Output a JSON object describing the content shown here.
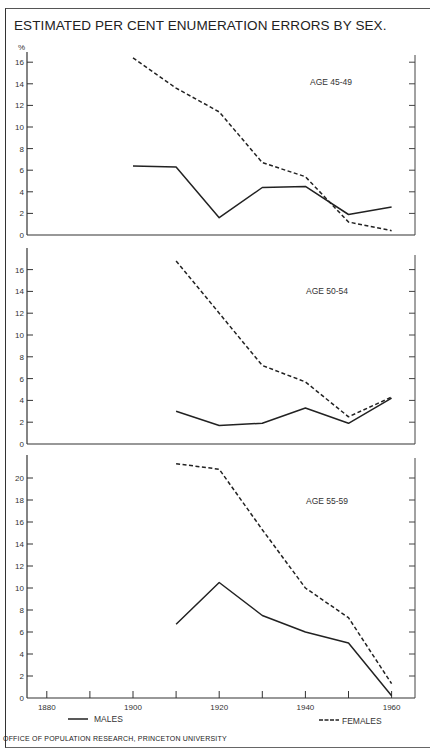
{
  "title": "ESTIMATED PER CENT ENUMERATION ERRORS BY SEX.",
  "y_unit": "%",
  "credit": "OFFICE OF POPULATION RESEARCH, PRINCETON UNIVERSITY",
  "legend": {
    "males": "MALES",
    "females": "FEMALES"
  },
  "x_ticks": [
    "1880",
    "1900",
    "1920",
    "1940",
    "1960"
  ],
  "chart_data": [
    {
      "type": "line",
      "title": "AGE 45-49",
      "xlabel": "",
      "ylabel": "%",
      "ylim": [
        0,
        17
      ],
      "yticks": [
        0,
        2,
        4,
        6,
        8,
        10,
        12,
        14,
        16
      ],
      "x": [
        1900,
        1910,
        1920,
        1930,
        1940,
        1950,
        1960
      ],
      "series": [
        {
          "name": "MALES",
          "style": "solid",
          "values": [
            6.4,
            6.3,
            1.6,
            4.4,
            4.5,
            1.9,
            2.6
          ]
        },
        {
          "name": "FEMALES",
          "style": "dashed",
          "values": [
            16.4,
            13.6,
            11.4,
            6.7,
            5.4,
            1.2,
            0.4
          ]
        }
      ]
    },
    {
      "type": "line",
      "title": "AGE 50-54",
      "xlabel": "",
      "ylabel": "%",
      "ylim": [
        0,
        18
      ],
      "yticks": [
        0,
        2,
        4,
        6,
        8,
        10,
        12,
        14,
        16
      ],
      "x": [
        1910,
        1920,
        1930,
        1940,
        1950,
        1960
      ],
      "series": [
        {
          "name": "MALES",
          "style": "solid",
          "values": [
            3.0,
            1.7,
            1.9,
            3.3,
            1.9,
            4.2
          ]
        },
        {
          "name": "FEMALES",
          "style": "dashed",
          "values": [
            16.8,
            12.0,
            7.2,
            5.7,
            2.5,
            4.3
          ]
        }
      ]
    },
    {
      "type": "line",
      "title": "AGE 55-59",
      "xlabel": "",
      "ylabel": "%",
      "ylim": [
        0,
        22
      ],
      "yticks": [
        0,
        2,
        4,
        6,
        8,
        10,
        12,
        14,
        16,
        18,
        20
      ],
      "x": [
        1910,
        1920,
        1930,
        1940,
        1950,
        1960
      ],
      "xticks": [
        1880,
        1900,
        1920,
        1940,
        1960
      ],
      "series": [
        {
          "name": "MALES",
          "style": "solid",
          "values": [
            6.7,
            10.5,
            7.5,
            6.0,
            5.0,
            0.2
          ]
        },
        {
          "name": "FEMALES",
          "style": "dashed",
          "values": [
            21.3,
            20.8,
            15.3,
            10.0,
            7.3,
            1.3
          ]
        }
      ]
    }
  ]
}
